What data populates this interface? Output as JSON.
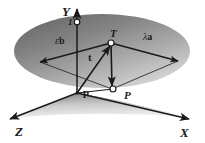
{
  "figure": {
    "background_color": "#ffffff",
    "stroke_color": "#1a1a1a",
    "plane_fill_dark": "#6e6e6e",
    "plane_fill_light": "#d8d8d8",
    "ground_fill_dark": "#8c8c8c",
    "ground_fill_light": "#f2f2f2",
    "node_fill": "#ffffff"
  },
  "axes": [
    {
      "id": "y",
      "label": "Y",
      "direction": "up"
    },
    {
      "id": "x",
      "label": "X",
      "direction": "lower-right"
    },
    {
      "id": "z",
      "label": "Z",
      "direction": "lower-left"
    }
  ],
  "points": [
    {
      "id": "origin",
      "label": "p",
      "style": "bold-roman",
      "role": "origin-position-vector"
    },
    {
      "id": "unit",
      "label": "1",
      "style": "italic",
      "role": "unit-mark-on-y-axis"
    },
    {
      "id": "t-point",
      "label": "T",
      "style": "italic",
      "role": "point-on-plane"
    },
    {
      "id": "p-point",
      "label": "P",
      "style": "italic",
      "role": "projected-point"
    }
  ],
  "vectors": [
    {
      "id": "t-vector",
      "label": "t",
      "style": "bold-roman",
      "role": "vector-from-origin-to-T"
    },
    {
      "id": "lambda-a",
      "label_prefix": "λ",
      "label_suffix": "a",
      "role": "basis-vector-a-scaled"
    },
    {
      "id": "epsilon-b",
      "label_prefix": "ε",
      "label_suffix": "b",
      "role": "basis-vector-b-scaled"
    }
  ],
  "labels": {
    "axis_y": "Y",
    "axis_x": "X",
    "axis_z": "Z",
    "point_T": "T",
    "point_P": "P",
    "point_p_bold": "p",
    "vector_t_bold": "t",
    "unit_one": "1",
    "coef_lambda": "λ",
    "basis_a": "a",
    "coef_epsilon": "ε",
    "basis_b": "b"
  }
}
